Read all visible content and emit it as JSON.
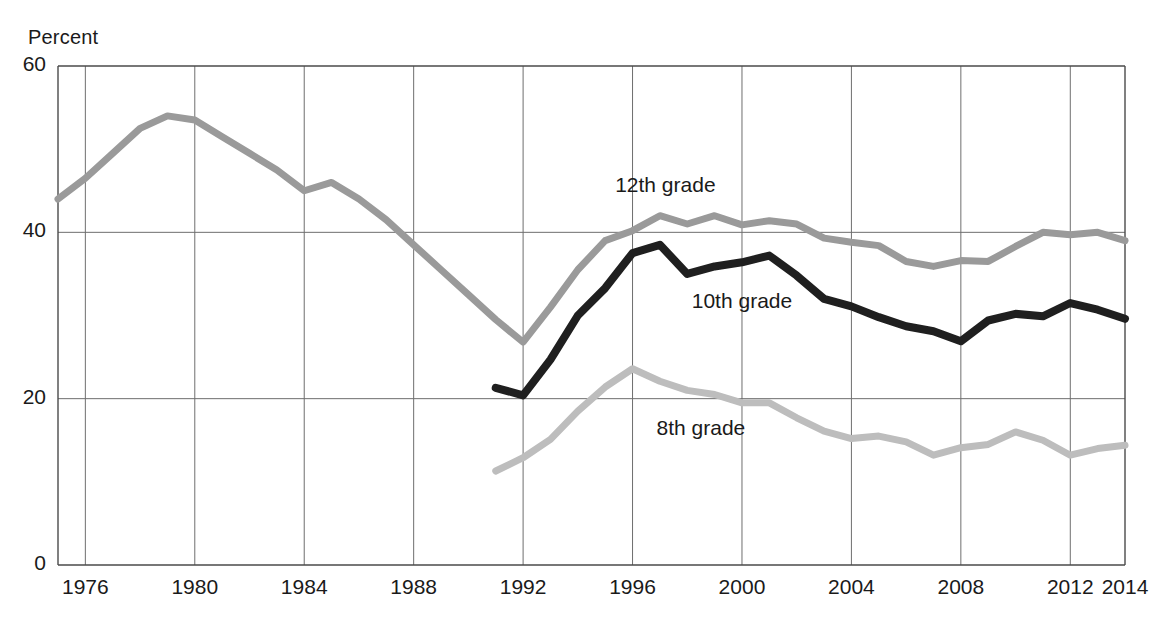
{
  "chart_data": {
    "type": "line",
    "title": "",
    "ylabel": "Percent",
    "xlabel": "",
    "ylim": [
      0,
      60
    ],
    "xlim": [
      1975,
      2014
    ],
    "yticks": [
      0,
      20,
      40,
      60
    ],
    "ytick_labels": [
      "0",
      "20",
      "40",
      "60"
    ],
    "xticks": [
      1976,
      1980,
      1984,
      1988,
      1992,
      1996,
      2000,
      2004,
      2008,
      2012,
      2014
    ],
    "xtick_labels": [
      "1976",
      "1980",
      "1984",
      "1988",
      "1992",
      "1996",
      "2000",
      "2004",
      "2008",
      "2012",
      "2014"
    ],
    "grid": true,
    "legend_position": "inline-annotations",
    "series": [
      {
        "name": "12th grade",
        "color": "#9a9a9a",
        "label_x": 1997.2,
        "label_y": 45.5,
        "x": [
          1975,
          1976,
          1977,
          1978,
          1979,
          1980,
          1981,
          1982,
          1983,
          1984,
          1985,
          1986,
          1987,
          1988,
          1989,
          1990,
          1991,
          1992,
          1993,
          1994,
          1995,
          1996,
          1997,
          1998,
          1999,
          2000,
          2001,
          2002,
          2003,
          2004,
          2005,
          2006,
          2007,
          2008,
          2009,
          2010,
          2011,
          2012,
          2013,
          2014
        ],
        "values": [
          44.0,
          46.5,
          49.5,
          52.5,
          54.0,
          53.5,
          51.5,
          49.5,
          47.5,
          45.0,
          46.0,
          44.0,
          41.5,
          38.5,
          35.5,
          32.5,
          29.5,
          26.8,
          31.0,
          35.5,
          39.0,
          40.2,
          42.0,
          41.0,
          42.0,
          40.9,
          41.4,
          41.0,
          39.3,
          38.8,
          38.4,
          36.5,
          35.9,
          36.6,
          36.5,
          38.3,
          40.0,
          39.7,
          40.0,
          39.0
        ]
      },
      {
        "name": "10th grade",
        "color": "#1f1f1f",
        "label_x": 2000.0,
        "label_y": 31.5,
        "x": [
          1991,
          1992,
          1993,
          1994,
          1995,
          1996,
          1997,
          1998,
          1999,
          2000,
          2001,
          2002,
          2003,
          2004,
          2005,
          2006,
          2007,
          2008,
          2009,
          2010,
          2011,
          2012,
          2013,
          2014
        ],
        "values": [
          21.3,
          20.4,
          24.7,
          30.0,
          33.3,
          37.5,
          38.5,
          35.0,
          35.9,
          36.4,
          37.2,
          34.8,
          32.0,
          31.1,
          29.8,
          28.7,
          28.1,
          26.9,
          29.4,
          30.2,
          29.9,
          31.5,
          30.7,
          29.6
        ]
      },
      {
        "name": "8th grade",
        "color": "#bdbdbd",
        "label_x": 1998.5,
        "label_y": 16.2,
        "x": [
          1991,
          1992,
          1993,
          1994,
          1995,
          1996,
          1997,
          1998,
          1999,
          2000,
          2001,
          2002,
          2003,
          2004,
          2005,
          2006,
          2007,
          2008,
          2009,
          2010,
          2011,
          2012,
          2013,
          2014
        ],
        "values": [
          11.3,
          12.9,
          15.1,
          18.5,
          21.4,
          23.6,
          22.1,
          21.0,
          20.5,
          19.5,
          19.5,
          17.7,
          16.1,
          15.2,
          15.5,
          14.8,
          13.2,
          14.1,
          14.5,
          16.0,
          15.0,
          13.2,
          14.0,
          14.4
        ]
      }
    ]
  }
}
